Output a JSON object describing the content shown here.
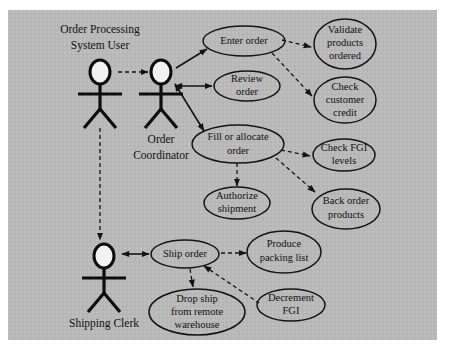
{
  "diagram": {
    "type": "uml-use-case",
    "background_color": "#b9b9b9",
    "page_color": "#ffffff",
    "stroke_color": "#141414",
    "actors": [
      {
        "id": "order-processing-system-user",
        "label_line1": "Order Processing",
        "label_line2": "System User",
        "x": 100,
        "label_y": 30,
        "label_above": true
      },
      {
        "id": "order-coordinator",
        "label_line1": "Order",
        "label_line2": "Coordinator",
        "x": 161,
        "label_y": 138,
        "label_above": false
      },
      {
        "id": "shipping-clerk",
        "label_line1": "Shipping Clerk",
        "label_line2": "",
        "x": 104,
        "label_y": 322,
        "label_above": false
      }
    ],
    "use_cases": [
      {
        "id": "enter-order",
        "lines": [
          "Enter order"
        ],
        "cx": 244,
        "cy": 41,
        "rx": 41,
        "ry": 15
      },
      {
        "id": "review-order",
        "lines": [
          "Review",
          "order"
        ],
        "cx": 247,
        "cy": 86,
        "rx": 33,
        "ry": 15
      },
      {
        "id": "fill-allocate",
        "lines": [
          "Fill or allocate",
          "order"
        ],
        "cx": 238,
        "cy": 144,
        "rx": 46,
        "ry": 19
      },
      {
        "id": "authorize-shipment",
        "lines": [
          "Authorize",
          "shipment"
        ],
        "cx": 237,
        "cy": 203,
        "rx": 33,
        "ry": 16
      },
      {
        "id": "validate-products",
        "lines": [
          "Validate",
          "products",
          "ordered"
        ],
        "cx": 345,
        "cy": 44,
        "rx": 31,
        "ry": 25
      },
      {
        "id": "check-credit",
        "lines": [
          "Check",
          "customer",
          "credit"
        ],
        "cx": 345,
        "cy": 100,
        "rx": 31,
        "ry": 23
      },
      {
        "id": "check-fgi-levels",
        "lines": [
          "Check FGI",
          "levels"
        ],
        "cx": 344,
        "cy": 155,
        "rx": 31,
        "ry": 16
      },
      {
        "id": "back-order",
        "lines": [
          "Back order",
          "products"
        ],
        "cx": 346,
        "cy": 209,
        "rx": 34,
        "ry": 20
      },
      {
        "id": "ship-order",
        "lines": [
          "Ship order"
        ],
        "cx": 185,
        "cy": 254,
        "rx": 34,
        "ry": 14
      },
      {
        "id": "produce-packing",
        "lines": [
          "Produce",
          "packing list"
        ],
        "cx": 284,
        "cy": 252,
        "rx": 37,
        "ry": 21
      },
      {
        "id": "decrement-fgi",
        "lines": [
          "Decrement",
          "FGI"
        ],
        "cx": 291,
        "cy": 305,
        "rx": 34,
        "ry": 16
      },
      {
        "id": "drop-ship",
        "lines": [
          "Drop ship",
          "from remote",
          "warehouse"
        ],
        "cx": 197,
        "cy": 312,
        "rx": 48,
        "ry": 23
      }
    ],
    "connections": [
      {
        "from": "order-processing-system-user",
        "to": "order-coordinator",
        "style": "dependency",
        "arrow": "open"
      },
      {
        "from": "order-processing-system-user",
        "to": "shipping-clerk",
        "style": "dependency",
        "arrow": "solid"
      },
      {
        "from": "order-coordinator",
        "to": "enter-order",
        "style": "association",
        "arrow": "solid"
      },
      {
        "from": "order-coordinator",
        "to": "review-order",
        "style": "association",
        "arrow": "both"
      },
      {
        "from": "order-coordinator",
        "to": "fill-allocate",
        "style": "association",
        "arrow": "solid"
      },
      {
        "from": "enter-order",
        "to": "validate-products",
        "style": "dependency",
        "arrow": "solid"
      },
      {
        "from": "enter-order",
        "to": "check-credit",
        "style": "dependency",
        "arrow": "solid"
      },
      {
        "from": "fill-allocate",
        "to": "check-fgi-levels",
        "style": "dependency",
        "arrow": "solid"
      },
      {
        "from": "fill-allocate",
        "to": "back-order",
        "style": "dependency",
        "arrow": "solid"
      },
      {
        "from": "fill-allocate",
        "to": "authorize-shipment",
        "style": "dependency",
        "arrow": "solid"
      },
      {
        "from": "shipping-clerk",
        "to": "ship-order",
        "style": "association",
        "arrow": "both"
      },
      {
        "from": "ship-order",
        "to": "produce-packing",
        "style": "dependency",
        "arrow": "solid"
      },
      {
        "from": "ship-order",
        "to": "drop-ship",
        "style": "dependency",
        "arrow": "solid"
      },
      {
        "from": "ship-order",
        "to": "decrement-fgi",
        "style": "dependency",
        "arrow": "solid"
      }
    ]
  }
}
